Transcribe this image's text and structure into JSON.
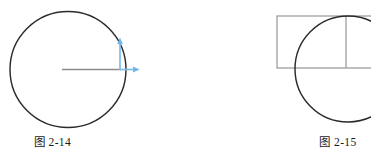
{
  "page": {
    "background_color": "#ffffff",
    "width": 371,
    "height": 155
  },
  "figures": [
    {
      "id": "fig-2-14",
      "caption": "图 2-14",
      "description": "Circle with horizontal radius line and two blue vector arrows at the right edge",
      "stroke_color": "#2b2b2b",
      "radius_line_color": "#8c8c8c",
      "arrow_color": "#6fb7e8",
      "circle": {
        "cx": 68,
        "cy": 69.5,
        "r": 58,
        "stroke_width": 1.4
      },
      "radius_line": {
        "x1": 62,
        "y1": 69.5,
        "x2": 120,
        "y2": 69.5
      },
      "arrows": [
        {
          "name": "tangential-velocity-arrow",
          "direction": "right",
          "x1": 120,
          "y1": 69.5,
          "x2": 139,
          "y2": 69.5
        },
        {
          "name": "radial-arrow",
          "direction": "up",
          "x1": 120,
          "y1": 70,
          "x2": 120,
          "y2": 38
        }
      ]
    },
    {
      "id": "fig-2-15",
      "caption": "图 2-15",
      "description": "Rectangle overlapping a circle, with an internal vertical divider line; both clipped at the right page edge",
      "stroke_color": "#2b2b2b",
      "rect_color": "#8c8c8c",
      "circle": {
        "cx": 348,
        "cy": 69,
        "r": 53,
        "stroke_width": 1.4
      },
      "rectangle": {
        "x": 277,
        "y": 16,
        "width": 100,
        "height": 52,
        "stroke_width": 1
      },
      "divider_line": {
        "x1": 346,
        "y1": 16,
        "x2": 346,
        "y2": 68
      }
    }
  ],
  "colors": {
    "ink": "#2b2b2b",
    "gray_line": "#8c8c8c",
    "accent_blue": "#6fb7e8",
    "paper": "#ffffff"
  }
}
